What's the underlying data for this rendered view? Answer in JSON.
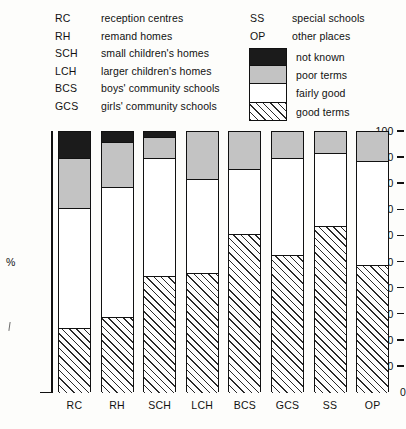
{
  "key": {
    "abbreviations_left": [
      {
        "code": "RC",
        "text": "reception centres"
      },
      {
        "code": "RH",
        "text": "remand homes"
      },
      {
        "code": "SCH",
        "text": "small children's homes"
      },
      {
        "code": "LCH",
        "text": "larger children's homes"
      },
      {
        "code": "BCS",
        "text": "boys' community schools"
      },
      {
        "code": "GCS",
        "text": "girls' community schools"
      }
    ],
    "abbreviations_right": [
      {
        "code": "SS",
        "text": "special schools"
      },
      {
        "code": "OP",
        "text": "other places"
      }
    ],
    "swatches": [
      {
        "label": "not known",
        "pattern": "fill-notknown",
        "color": "#1b1b1b"
      },
      {
        "label": "poor terms",
        "pattern": "fill-poor",
        "color": "#c3c3c3"
      },
      {
        "label": "fairly good",
        "pattern": "fill-fairly",
        "color": "#ffffff"
      },
      {
        "label": "good terms",
        "pattern": "fill-good",
        "color": "#ffffff"
      }
    ]
  },
  "axis": {
    "unit_label": "%",
    "ticks": [
      "100",
      "90",
      "80",
      "70",
      "60",
      "50",
      "40",
      "30",
      "20",
      "10",
      "0"
    ]
  },
  "chart_data": {
    "type": "bar",
    "stacked": true,
    "title": "",
    "xlabel": "",
    "ylabel": "%",
    "ylim": [
      0,
      100
    ],
    "yticks": [
      0,
      10,
      20,
      30,
      40,
      50,
      60,
      70,
      80,
      90,
      100
    ],
    "grid": false,
    "legend_position": "top-right",
    "categories": [
      "RC",
      "RH",
      "SCH",
      "LCH",
      "BCS",
      "GCS",
      "SS",
      "OP"
    ],
    "category_names": [
      "reception centres",
      "remand homes",
      "small children's homes",
      "larger children's homes",
      "boys' community schools",
      "girls' community schools",
      "special schools",
      "other places"
    ],
    "series": [
      {
        "name": "good terms",
        "values": [
          25,
          29,
          45,
          46,
          61,
          53,
          64,
          49
        ]
      },
      {
        "name": "fairly good",
        "values": [
          46,
          50,
          45,
          36,
          25,
          37,
          28,
          40
        ]
      },
      {
        "name": "poor terms",
        "values": [
          19,
          17,
          8,
          18,
          14,
          10,
          8,
          11
        ]
      },
      {
        "name": "not known",
        "values": [
          10,
          4,
          2,
          0,
          0,
          0,
          0,
          0
        ]
      }
    ],
    "cumulative_tops": {
      "good_terms": [
        25,
        29,
        45,
        46,
        61,
        53,
        64,
        49
      ],
      "fairly_good": [
        71,
        79,
        90,
        82,
        86,
        90,
        92,
        89
      ],
      "poor_terms": [
        90,
        96,
        98,
        100,
        100,
        100,
        100,
        100
      ],
      "not_known": [
        100,
        100,
        100,
        100,
        100,
        100,
        100,
        100
      ]
    }
  }
}
